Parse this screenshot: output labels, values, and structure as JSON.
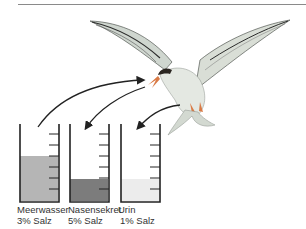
{
  "diagram": {
    "colors": {
      "meerwasser_fill": "#b5b5b5",
      "nasensekret_fill": "#7c7c7c",
      "urin_fill": "#ececec",
      "beaker_outline": "#222222",
      "arrow": "#222222",
      "bird_body": "#dde2dc",
      "bird_cap": "#2a2520",
      "beak_feet": "#d97a45"
    },
    "beakers": [
      {
        "name": "Meerwasser",
        "value": "3% Salz",
        "fill_level": 0.43
      },
      {
        "name": "Nasensekret",
        "value": "5% Salz",
        "fill_level": 0.22
      },
      {
        "name": "Urin",
        "value": "1% Salz",
        "fill_level": 0.22
      }
    ],
    "arrows": [
      {
        "from": "Meerwasser",
        "to": "beak",
        "direction": "in"
      },
      {
        "from": "beak",
        "to": "Nasensekret",
        "direction": "out"
      },
      {
        "from": "body",
        "to": "Urin",
        "direction": "out"
      }
    ]
  }
}
